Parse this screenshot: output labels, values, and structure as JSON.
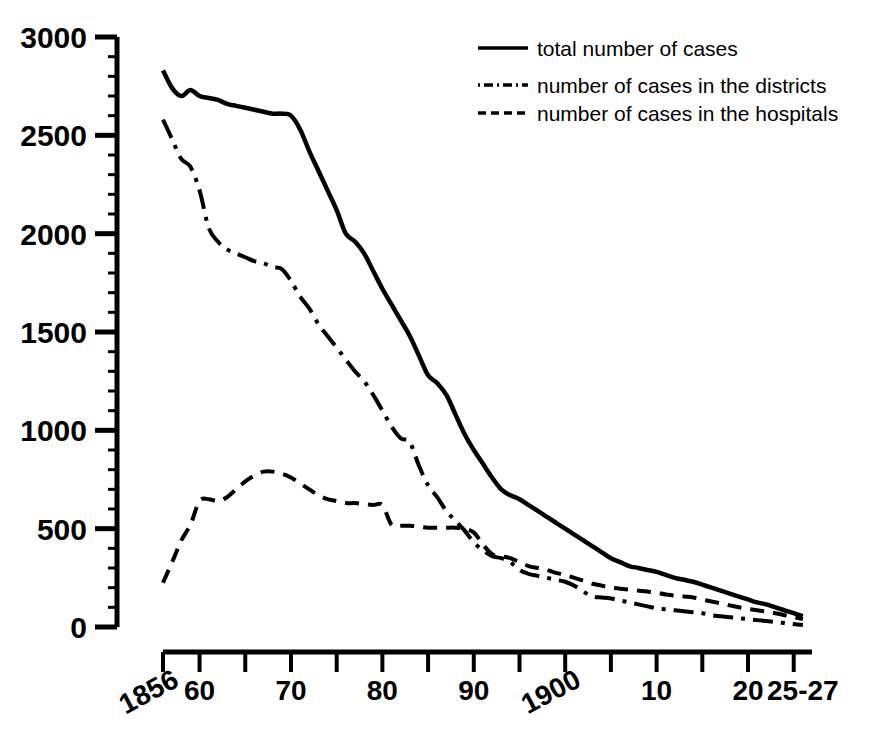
{
  "chart_data": {
    "type": "line",
    "title": "",
    "subtitle": "",
    "xlabel": "",
    "ylabel": "",
    "xlim": [
      1856,
      1927
    ],
    "ylim": [
      0,
      3000
    ],
    "grid": false,
    "legend_position": "top-right",
    "y_ticks": [
      0,
      500,
      1000,
      1500,
      2000,
      2500,
      3000
    ],
    "y_tick_labels": [
      "0",
      "500",
      "1000",
      "1500",
      "2000",
      "2500",
      "3000"
    ],
    "y_minor_tick_step": 100,
    "x_ticks": [
      1856,
      1860,
      1865,
      1870,
      1875,
      1880,
      1885,
      1890,
      1895,
      1900,
      1905,
      1910,
      1915,
      1920,
      1925
    ],
    "x_tick_labels": [
      "1856",
      "60",
      "",
      "70",
      "",
      "80",
      "",
      "90",
      "",
      "1900",
      "",
      "10",
      "",
      "20",
      "25-27"
    ],
    "x_labeled_ticks": [
      {
        "x": 1856,
        "label": "1856",
        "rotated": true
      },
      {
        "x": 1860,
        "label": "60",
        "rotated": false
      },
      {
        "x": 1870,
        "label": "70",
        "rotated": false
      },
      {
        "x": 1880,
        "label": "80",
        "rotated": false
      },
      {
        "x": 1890,
        "label": "90",
        "rotated": false
      },
      {
        "x": 1900,
        "label": "1900",
        "rotated": true
      },
      {
        "x": 1910,
        "label": "10",
        "rotated": false
      },
      {
        "x": 1920,
        "label": "20",
        "rotated": false
      },
      {
        "x": 1926,
        "label": "25-27",
        "rotated": false
      }
    ],
    "series": [
      {
        "name": "total number of cases",
        "style": "solid",
        "color": "#000000",
        "x": [
          1856,
          1857,
          1858,
          1859,
          1860,
          1861,
          1862,
          1863,
          1864,
          1865,
          1866,
          1867,
          1868,
          1869,
          1870,
          1871,
          1872,
          1873,
          1874,
          1875,
          1876,
          1877,
          1878,
          1879,
          1880,
          1881,
          1882,
          1883,
          1884,
          1885,
          1886,
          1887,
          1888,
          1889,
          1890,
          1891,
          1892,
          1893,
          1894,
          1895,
          1896,
          1897,
          1898,
          1899,
          1900,
          1901,
          1902,
          1903,
          1904,
          1905,
          1906,
          1907,
          1908,
          1909,
          1910,
          1911,
          1912,
          1913,
          1914,
          1915,
          1916,
          1917,
          1918,
          1919,
          1920,
          1921,
          1922,
          1923,
          1924,
          1925,
          1926
        ],
        "y": [
          2830,
          2740,
          2700,
          2730,
          2700,
          2690,
          2680,
          2660,
          2650,
          2640,
          2630,
          2620,
          2610,
          2610,
          2600,
          2530,
          2420,
          2320,
          2220,
          2120,
          2000,
          1960,
          1900,
          1810,
          1720,
          1640,
          1560,
          1480,
          1380,
          1280,
          1240,
          1180,
          1080,
          980,
          900,
          830,
          760,
          700,
          670,
          650,
          620,
          590,
          560,
          530,
          500,
          470,
          440,
          410,
          380,
          350,
          330,
          310,
          300,
          290,
          280,
          265,
          250,
          240,
          230,
          215,
          200,
          185,
          170,
          155,
          140,
          125,
          115,
          100,
          85,
          70,
          55
        ]
      },
      {
        "name": "number of cases in the districts",
        "style": "dashdot",
        "color": "#000000",
        "x": [
          1856,
          1857,
          1858,
          1859,
          1860,
          1861,
          1862,
          1863,
          1864,
          1865,
          1866,
          1867,
          1868,
          1869,
          1870,
          1871,
          1872,
          1873,
          1874,
          1875,
          1876,
          1877,
          1878,
          1879,
          1880,
          1881,
          1882,
          1883,
          1884,
          1885,
          1886,
          1887,
          1888,
          1889,
          1890,
          1891,
          1892,
          1893,
          1894,
          1895,
          1896,
          1897,
          1898,
          1899,
          1900,
          1901,
          1902,
          1903,
          1904,
          1905,
          1906,
          1907,
          1908,
          1909,
          1910,
          1911,
          1912,
          1913,
          1914,
          1915,
          1916,
          1917,
          1918,
          1919,
          1920,
          1921,
          1922,
          1923,
          1924,
          1925,
          1926
        ],
        "y": [
          2580,
          2480,
          2380,
          2340,
          2220,
          2030,
          1960,
          1920,
          1900,
          1880,
          1860,
          1850,
          1830,
          1820,
          1760,
          1680,
          1620,
          1540,
          1480,
          1420,
          1360,
          1300,
          1250,
          1180,
          1100,
          1020,
          960,
          940,
          820,
          720,
          660,
          590,
          540,
          490,
          430,
          390,
          360,
          350,
          330,
          290,
          270,
          260,
          250,
          240,
          230,
          210,
          180,
          155,
          150,
          145,
          135,
          125,
          115,
          105,
          95,
          90,
          85,
          80,
          75,
          70,
          60,
          55,
          50,
          45,
          40,
          35,
          30,
          25,
          20,
          15,
          10
        ]
      },
      {
        "name": "number of cases in the hospitals",
        "style": "dashed",
        "color": "#000000",
        "x": [
          1856,
          1857,
          1858,
          1859,
          1860,
          1861,
          1862,
          1863,
          1864,
          1865,
          1866,
          1867,
          1868,
          1869,
          1870,
          1871,
          1872,
          1873,
          1874,
          1875,
          1876,
          1877,
          1878,
          1879,
          1880,
          1881,
          1882,
          1883,
          1884,
          1885,
          1886,
          1887,
          1888,
          1889,
          1890,
          1891,
          1892,
          1893,
          1894,
          1895,
          1896,
          1897,
          1898,
          1899,
          1900,
          1901,
          1902,
          1903,
          1904,
          1905,
          1906,
          1907,
          1908,
          1909,
          1910,
          1911,
          1912,
          1913,
          1914,
          1915,
          1916,
          1917,
          1918,
          1919,
          1920,
          1921,
          1922,
          1923,
          1924,
          1925,
          1926
        ],
        "y": [
          225,
          330,
          440,
          520,
          640,
          650,
          640,
          660,
          700,
          740,
          770,
          790,
          790,
          780,
          760,
          730,
          700,
          670,
          650,
          640,
          630,
          630,
          625,
          620,
          620,
          520,
          515,
          515,
          510,
          505,
          505,
          505,
          505,
          500,
          480,
          420,
          370,
          360,
          350,
          330,
          310,
          300,
          290,
          275,
          265,
          250,
          235,
          220,
          210,
          200,
          195,
          190,
          185,
          180,
          175,
          165,
          160,
          155,
          150,
          140,
          130,
          120,
          110,
          100,
          92,
          85,
          78,
          70,
          60,
          50,
          40
        ]
      }
    ],
    "legend": [
      {
        "label": "total number of cases",
        "style": "solid"
      },
      {
        "label": "number of cases in the districts",
        "style": "dashdot"
      },
      {
        "label": "number of cases in the hospitals",
        "style": "dashed"
      }
    ]
  }
}
